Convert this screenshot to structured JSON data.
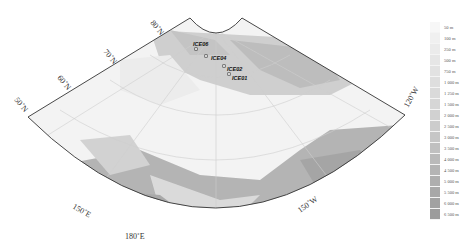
{
  "map": {
    "type": "polar conic bathymetric map",
    "latitude_labels": [
      {
        "text": "50˚N",
        "x": 14,
        "y": 100,
        "rot": 50
      },
      {
        "text": "60˚N",
        "x": 57,
        "y": 78,
        "rot": 50
      },
      {
        "text": "70˚N",
        "x": 103,
        "y": 52,
        "rot": 50
      },
      {
        "text": "80˚N",
        "x": 150,
        "y": 23,
        "rot": 50
      }
    ],
    "longitude_labels": [
      {
        "text": "150˚E",
        "x": 72,
        "y": 208,
        "rot": 30
      },
      {
        "text": "180˚E",
        "x": 125,
        "y": 239,
        "rot": 0
      },
      {
        "text": "150˚W",
        "x": 300,
        "y": 213,
        "rot": -35
      },
      {
        "text": "120˚W",
        "x": 408,
        "y": 108,
        "rot": -60
      }
    ],
    "sites": [
      {
        "name": "ICE06",
        "x": 196,
        "y": 49,
        "dx": 193,
        "dy": 46
      },
      {
        "name": "ICE04",
        "x": 206,
        "y": 56,
        "dx": 211,
        "dy": 60
      },
      {
        "name": "ICE02",
        "x": 224,
        "y": 66,
        "dx": 227,
        "dy": 71
      },
      {
        "name": "ICE01",
        "x": 229,
        "y": 74,
        "dx": 232,
        "dy": 80
      }
    ]
  },
  "legend": {
    "title": "Depth",
    "items": [
      {
        "label": "50 m",
        "color": "#f7f7f7"
      },
      {
        "label": "100 m",
        "color": "#f0f0f0"
      },
      {
        "label": "250 m",
        "color": "#ebebeb"
      },
      {
        "label": "500 m",
        "color": "#e6e6e6"
      },
      {
        "label": "750 m",
        "color": "#e2e2e2"
      },
      {
        "label": "1 000 m",
        "color": "#dedede"
      },
      {
        "label": "1 250 m",
        "color": "#dadada"
      },
      {
        "label": "1 500 m",
        "color": "#d6d6d6"
      },
      {
        "label": "2 000 m",
        "color": "#d1d1d1"
      },
      {
        "label": "2 500 m",
        "color": "#cccccc"
      },
      {
        "label": "3 000 m",
        "color": "#c6c6c6"
      },
      {
        "label": "3 500 m",
        "color": "#c0c0c0"
      },
      {
        "label": "4 000 m",
        "color": "#bababa"
      },
      {
        "label": "4 500 m",
        "color": "#b4b4b4"
      },
      {
        "label": "5 000 m",
        "color": "#aeaeae"
      },
      {
        "label": "5 500 m",
        "color": "#a8a8a8"
      },
      {
        "label": "6 000 m",
        "color": "#a2a2a2"
      },
      {
        "label": "6 500 m",
        "color": "#9c9c9c"
      }
    ]
  }
}
